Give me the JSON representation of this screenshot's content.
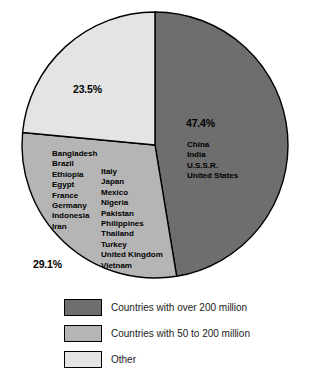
{
  "chart_data": {
    "type": "pie",
    "title": "",
    "subtitle": "",
    "xlabel": "",
    "ylabel": "",
    "grid": false,
    "legend_position": "bottom",
    "units": "percent of world population",
    "center": {
      "x": 155,
      "y": 145,
      "radius": 133
    },
    "start_angle_deg": 0,
    "direction": "clockwise",
    "categories": [
      "Countries with over 200 million",
      "Countries with 50 to 200 million",
      "Other"
    ],
    "values": [
      47.4,
      29.1,
      23.5
    ],
    "value_labels": [
      "47.4%",
      "29.1%",
      "23.5%"
    ],
    "colors": [
      "#6e6e6e",
      "#b5b5b5",
      "#e4e4e4"
    ],
    "outline_color": "#000000",
    "background_color": "#ffffff",
    "slices": [
      {
        "name": "Countries with over 200 million",
        "value": 47.4,
        "label": "47.4%",
        "color": "#6e6e6e",
        "start_deg": 0,
        "end_deg": 170.64,
        "members": [
          "China",
          "India",
          "U.S.S.R.",
          "United States"
        ]
      },
      {
        "name": "Countries with 50 to 200 million",
        "value": 29.1,
        "label": "29.1%",
        "color": "#b5b5b5",
        "start_deg": 170.64,
        "end_deg": 275.4,
        "members_column_1": [
          "Bangladesh",
          "Brazil",
          "Ethiopia",
          "Egypt",
          "France",
          "Germany",
          "Indonesia",
          "Iran"
        ],
        "members_column_2": [
          "Italy",
          "Japan",
          "Mexico",
          "Nigeria",
          "Pakistan",
          "Philippines",
          "Thailand",
          "Turkey",
          "United Kingdom",
          "Vietnam"
        ]
      },
      {
        "name": "Other",
        "value": 23.5,
        "label": "23.5%",
        "color": "#e4e4e4",
        "start_deg": 275.4,
        "end_deg": 360,
        "members": []
      }
    ],
    "legend": [
      {
        "label": "Countries with over 200 million",
        "color": "#6e6e6e"
      },
      {
        "label": "Countries with 50 to 200 million",
        "color": "#b5b5b5"
      },
      {
        "label": "Other",
        "color": "#e4e4e4"
      }
    ]
  }
}
